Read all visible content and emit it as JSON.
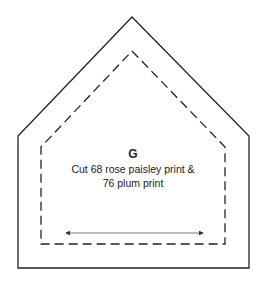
{
  "template": {
    "letter": "G",
    "instructions": [
      "Cut 68 rose paisley print &",
      "76 plum print"
    ],
    "colors": {
      "line": "#222222",
      "background": "#ffffff",
      "grainline": "#555555"
    },
    "shape": "pentagon",
    "grainline_direction": "horizontal"
  }
}
